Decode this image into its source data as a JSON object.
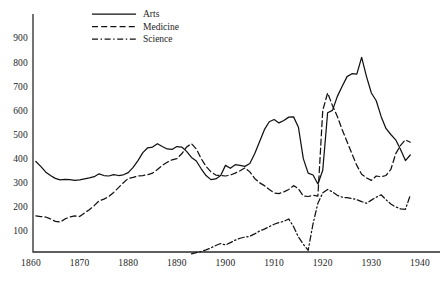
{
  "chart_data": {
    "type": "line",
    "title": "",
    "xlabel": "",
    "ylabel": "",
    "xlim": [
      1860,
      1942
    ],
    "ylim": [
      0,
      980
    ],
    "grid": false,
    "legend_position": "top-left",
    "xticks": [
      1860,
      1870,
      1880,
      1890,
      1900,
      1910,
      1920,
      1930,
      1940
    ],
    "xticklabels": [
      "1860",
      "1870",
      "1880",
      "1890",
      "1900",
      "1910",
      "1920",
      "1930",
      "1940"
    ],
    "yticks": [
      100,
      200,
      300,
      400,
      500,
      600,
      700,
      800,
      900
    ],
    "yticklabels": [
      "100",
      "200",
      "300",
      "400",
      "500",
      "600",
      "700",
      "800",
      "900"
    ],
    "series": [
      {
        "name": "Arts",
        "style": "solid",
        "color": "#111111",
        "x": [
          1861,
          1862,
          1863,
          1864,
          1865,
          1866,
          1867,
          1868,
          1869,
          1870,
          1871,
          1872,
          1873,
          1874,
          1875,
          1876,
          1877,
          1878,
          1879,
          1880,
          1881,
          1882,
          1883,
          1884,
          1885,
          1886,
          1887,
          1888,
          1889,
          1890,
          1891,
          1892,
          1893,
          1894,
          1895,
          1896,
          1897,
          1898,
          1899,
          1900,
          1901,
          1902,
          1903,
          1904,
          1905,
          1906,
          1907,
          1908,
          1909,
          1910,
          1911,
          1912,
          1913,
          1914,
          1915,
          1916,
          1917,
          1918,
          1919,
          1920,
          1921,
          1922,
          1923,
          1924,
          1925,
          1926,
          1927,
          1928,
          1929,
          1930,
          1931,
          1932,
          1933,
          1934,
          1935,
          1936,
          1937,
          1938
        ],
        "values": [
          388,
          368,
          345,
          330,
          318,
          312,
          314,
          313,
          310,
          312,
          316,
          320,
          325,
          337,
          330,
          328,
          334,
          330,
          333,
          342,
          364,
          392,
          425,
          445,
          448,
          462,
          450,
          440,
          438,
          450,
          448,
          430,
          405,
          390,
          358,
          330,
          313,
          316,
          330,
          372,
          360,
          375,
          372,
          368,
          380,
          420,
          470,
          520,
          553,
          562,
          548,
          558,
          572,
          573,
          530,
          400,
          340,
          332,
          295,
          352,
          590,
          600,
          658,
          700,
          740,
          752,
          750,
          820,
          740,
          672,
          640,
          575,
          525,
          500,
          478,
          438,
          392,
          415
        ]
      },
      {
        "name": "Medicine",
        "style": "dashed",
        "color": "#111111",
        "x": [
          1861,
          1862,
          1863,
          1864,
          1865,
          1866,
          1867,
          1868,
          1869,
          1870,
          1871,
          1872,
          1873,
          1874,
          1875,
          1876,
          1877,
          1878,
          1879,
          1880,
          1881,
          1882,
          1883,
          1884,
          1885,
          1886,
          1887,
          1888,
          1889,
          1890,
          1891,
          1892,
          1893,
          1894,
          1895,
          1896,
          1897,
          1898,
          1899,
          1900,
          1901,
          1902,
          1903,
          1904,
          1905,
          1906,
          1907,
          1908,
          1909,
          1910,
          1911,
          1912,
          1913,
          1914,
          1915,
          1916,
          1917,
          1918,
          1919,
          1920,
          1921,
          1922,
          1923,
          1924,
          1925,
          1926,
          1927,
          1928,
          1929,
          1930,
          1931,
          1932,
          1933,
          1934,
          1935,
          1936,
          1937,
          1938
        ],
        "values": [
          163,
          160,
          158,
          150,
          140,
          137,
          150,
          158,
          163,
          160,
          175,
          188,
          205,
          225,
          232,
          243,
          260,
          280,
          300,
          318,
          322,
          328,
          330,
          333,
          340,
          355,
          372,
          385,
          395,
          400,
          420,
          448,
          462,
          440,
          400,
          368,
          345,
          332,
          330,
          328,
          332,
          340,
          350,
          362,
          345,
          318,
          300,
          288,
          272,
          258,
          255,
          262,
          272,
          288,
          275,
          245,
          243,
          248,
          245,
          600,
          672,
          620,
          575,
          520,
          470,
          420,
          372,
          335,
          320,
          310,
          328,
          325,
          330,
          355,
          420,
          455,
          478,
          468
        ]
      },
      {
        "name": "Science",
        "style": "dashdot",
        "color": "#111111",
        "x": [
          1893,
          1894,
          1895,
          1896,
          1897,
          1898,
          1899,
          1900,
          1901,
          1902,
          1903,
          1904,
          1905,
          1906,
          1907,
          1908,
          1909,
          1910,
          1911,
          1912,
          1913,
          1914,
          1915,
          1916,
          1917,
          1918,
          1919,
          1920,
          1921,
          1922,
          1923,
          1924,
          1925,
          1926,
          1927,
          1928,
          1929,
          1930,
          1931,
          1932,
          1933,
          1934,
          1935,
          1936,
          1937,
          1938
        ],
        "values": [
          5,
          10,
          15,
          22,
          30,
          40,
          48,
          42,
          52,
          62,
          70,
          75,
          78,
          88,
          100,
          108,
          118,
          128,
          135,
          140,
          150,
          118,
          75,
          45,
          20,
          130,
          215,
          258,
          272,
          262,
          248,
          240,
          238,
          235,
          230,
          222,
          215,
          228,
          240,
          250,
          230,
          212,
          200,
          192,
          190,
          248
        ]
      }
    ]
  },
  "legend": {
    "items": [
      {
        "label": "Arts",
        "style": "solid"
      },
      {
        "label": "Medicine",
        "style": "dashed"
      },
      {
        "label": "Science",
        "style": "dashdot"
      }
    ]
  }
}
